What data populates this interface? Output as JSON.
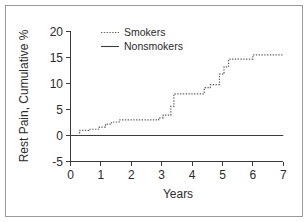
{
  "chart_data": {
    "type": "line",
    "title": "",
    "xlabel": "Years",
    "ylabel": "Rest Pain, Cumulative %",
    "xlim": [
      0,
      7
    ],
    "ylim": [
      -5,
      20
    ],
    "xticks": [
      0,
      1,
      2,
      3,
      4,
      5,
      6,
      7
    ],
    "yticks": [
      -5,
      0,
      5,
      10,
      15,
      20
    ],
    "xtick_labels": [
      "0",
      "1",
      "2",
      "3",
      "4",
      "5",
      "6",
      "7"
    ],
    "ytick_labels": [
      "-5",
      "0",
      "5",
      "10",
      "15",
      "20"
    ],
    "grid": false,
    "legend_position": "top-left",
    "series": [
      {
        "name": "Smokers",
        "style": "dotted",
        "color": "#5a5a5a",
        "step": true,
        "x": [
          0.0,
          0.3,
          0.3,
          0.6,
          0.6,
          0.95,
          0.95,
          1.15,
          1.15,
          1.35,
          1.35,
          1.6,
          1.6,
          2.9,
          2.9,
          3.05,
          3.05,
          3.3,
          3.3,
          3.4,
          3.4,
          4.4,
          4.4,
          4.6,
          4.6,
          4.9,
          4.9,
          5.05,
          5.05,
          5.2,
          5.2,
          6.0,
          6.0,
          7.0
        ],
        "y": [
          0.0,
          0.0,
          1.0,
          1.0,
          1.2,
          1.2,
          1.6,
          1.6,
          2.2,
          2.2,
          2.6,
          2.6,
          3.0,
          3.0,
          3.4,
          3.4,
          3.9,
          3.9,
          5.6,
          5.6,
          8.0,
          8.0,
          9.2,
          9.2,
          9.8,
          9.8,
          11.8,
          11.8,
          13.2,
          13.2,
          14.7,
          14.7,
          15.5,
          15.5
        ]
      },
      {
        "name": "Nonsmokers",
        "style": "solid",
        "color": "#3d3d3d",
        "step": true,
        "x": [
          0.0,
          7.0
        ],
        "y": [
          0.0,
          0.0
        ]
      }
    ]
  },
  "legend": {
    "entries": [
      {
        "label": "Smokers",
        "style": "dotted"
      },
      {
        "label": "Nonsmokers",
        "style": "solid"
      }
    ]
  },
  "axes": {
    "y_title": "Rest Pain, Cumulative %",
    "x_title": "Years"
  },
  "colors": {
    "frame_border": "#9a9a9a",
    "axis": "#3a3a3a",
    "text": "#2b2b2b",
    "smokers_line": "#5a5a5a",
    "nonsmokers_line": "#3d3d3d",
    "background": "#ffffff"
  }
}
